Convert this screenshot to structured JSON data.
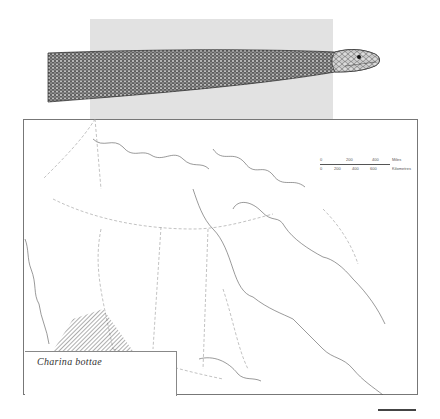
{
  "figure": {
    "species_label": "Charina bottae",
    "colors": {
      "panel_gray": "#e2e2e2",
      "frame": "#777777",
      "coast": "#555555",
      "boundary": "#999999",
      "hatch": "#333333"
    }
  },
  "scale_bar": {
    "miles": {
      "unit": "Miles",
      "ticks": [
        "0",
        "200",
        "400"
      ]
    },
    "kilometres": {
      "unit": "Kilometres",
      "ticks": [
        "0",
        "200",
        "400",
        "600"
      ]
    }
  },
  "map": {
    "region": "Canada",
    "range_area": "southern British Columbia (hatched)"
  }
}
